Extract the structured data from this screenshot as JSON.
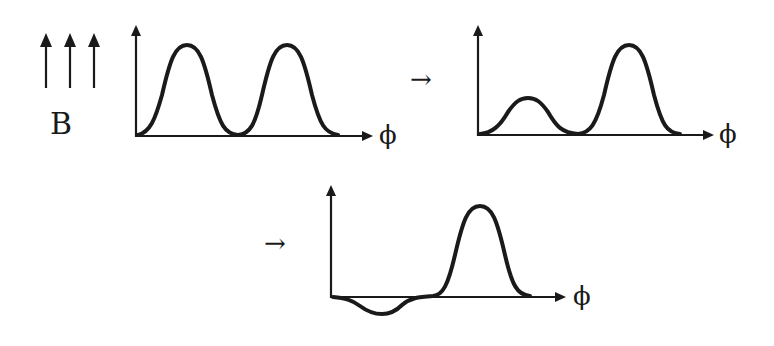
{
  "field": {
    "label": "B",
    "arrow_count": 3,
    "direction": "up"
  },
  "transition_symbol": "→",
  "axis_label": "ϕ",
  "colors": {
    "ink": "#1a1a1a",
    "background": "#ffffff"
  },
  "panels": [
    {
      "id": "initial",
      "description": "two equal peaks",
      "peaks": [
        {
          "position": 0.22,
          "height": 1.0
        },
        {
          "position": 0.65,
          "height": 1.0
        }
      ]
    },
    {
      "id": "step-2",
      "description": "first peak reduced",
      "peaks": [
        {
          "position": 0.22,
          "height": 0.4
        },
        {
          "position": 0.65,
          "height": 1.0
        }
      ]
    },
    {
      "id": "step-3",
      "description": "first peak inverted",
      "peaks": [
        {
          "position": 0.22,
          "height": -0.2
        },
        {
          "position": 0.65,
          "height": 1.0
        }
      ]
    }
  ]
}
